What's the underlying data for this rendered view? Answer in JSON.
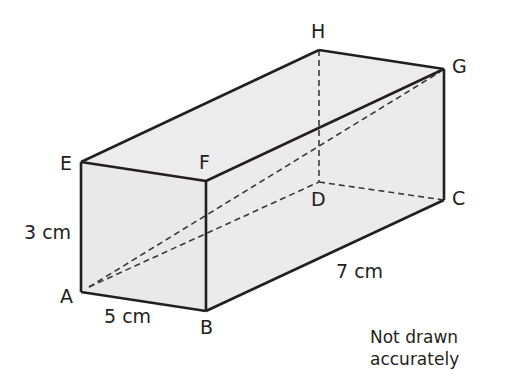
{
  "diagram": {
    "type": "cuboid",
    "fill_color": "#ebebeb",
    "edge_color": "#231f20",
    "vertices": {
      "A": [
        81,
        292
      ],
      "B": [
        206,
        311
      ],
      "E": [
        81,
        162
      ],
      "F": [
        206,
        181
      ],
      "D": [
        319,
        182
      ],
      "C": [
        444,
        200
      ],
      "H": [
        319,
        50
      ],
      "G": [
        444,
        69
      ]
    },
    "solid_edges": [
      "AB",
      "AE",
      "BF",
      "EF",
      "EH",
      "FG",
      "HG",
      "BC",
      "GC"
    ],
    "dashed_edges": [
      "AG",
      "AD",
      "DH",
      "DC"
    ],
    "labels": {
      "A": "A",
      "B": "B",
      "C": "C",
      "D": "D",
      "E": "E",
      "F": "F",
      "G": "G",
      "H": "H"
    },
    "dimensions": {
      "height": "3 cm",
      "width": "5 cm",
      "length": "7 cm"
    },
    "note_line1": "Not drawn",
    "note_line2": "accurately"
  }
}
